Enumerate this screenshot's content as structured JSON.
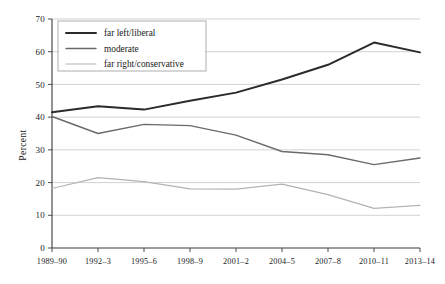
{
  "chart_data": {
    "type": "line",
    "title": "",
    "xlabel": "",
    "ylabel": "Percent",
    "categories": [
      "1989–90",
      "1992–3",
      "1995–6",
      "1998–9",
      "2001–2",
      "2004–5",
      "2007–8",
      "2010–11",
      "2013–14"
    ],
    "ylim": [
      0,
      70
    ],
    "yticks": [
      0,
      10,
      20,
      30,
      40,
      50,
      60,
      70
    ],
    "ytick_labels": [
      "0",
      "10",
      "20",
      "30",
      "40",
      "50",
      "60",
      "70"
    ],
    "grid": "horizontal",
    "legend_position": "upper-left",
    "series": [
      {
        "name": "far left/liberal",
        "color": "#2b2b2b",
        "values": [
          41.5,
          43.3,
          42.3,
          45.0,
          47.5,
          51.5,
          56.0,
          62.8,
          59.8
        ]
      },
      {
        "name": "moderate",
        "color": "#6a6a6a",
        "values": [
          40.2,
          35.0,
          37.8,
          37.4,
          34.5,
          29.5,
          28.5,
          25.5,
          27.5
        ]
      },
      {
        "name": "far right/conservative",
        "color": "#b3b3b3",
        "values": [
          18.2,
          21.5,
          20.3,
          18.1,
          18.0,
          19.5,
          16.3,
          12.1,
          13.0
        ]
      }
    ]
  },
  "axis": {
    "y_label": "Percent"
  },
  "legend": {
    "entries": [
      {
        "label": "far left/liberal"
      },
      {
        "label": "moderate"
      },
      {
        "label": "far right/conservative"
      }
    ]
  }
}
